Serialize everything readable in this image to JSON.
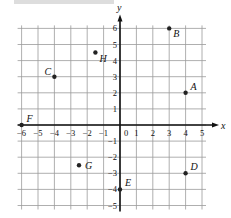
{
  "header": {
    "text": ""
  },
  "chart_data": {
    "type": "scatter",
    "title": "",
    "xlabel": "x",
    "ylabel": "y",
    "xlim": [
      -6,
      5
    ],
    "ylim": [
      -5,
      6
    ],
    "grid": true,
    "x_ticks": [
      "-6",
      "-5",
      "-4",
      "-3",
      "-2",
      "-1",
      "0",
      "1",
      "2",
      "3",
      "4",
      "5"
    ],
    "y_ticks": [
      "-5",
      "-4",
      "-3",
      "-2",
      "-1",
      "1",
      "2",
      "3",
      "4",
      "5",
      "6"
    ],
    "points": [
      {
        "label": "A",
        "x": 4,
        "y": 2,
        "label_pos": "above-right"
      },
      {
        "label": "B",
        "x": 3,
        "y": 6,
        "label_pos": "below-right"
      },
      {
        "label": "C",
        "x": -4,
        "y": 3,
        "label_pos": "above-left"
      },
      {
        "label": "D",
        "x": 4,
        "y": -3,
        "label_pos": "above-right"
      },
      {
        "label": "E",
        "x": 0,
        "y": -4,
        "label_pos": "above-right"
      },
      {
        "label": "F",
        "x": -6,
        "y": 0,
        "label_pos": "above-right"
      },
      {
        "label": "G",
        "x": -2.5,
        "y": -2.5,
        "label_pos": "right"
      },
      {
        "label": "H",
        "x": -1.5,
        "y": 4.5,
        "label_pos": "below-right"
      }
    ]
  },
  "colors": {
    "axis": "#111111",
    "grid": "#9a9a9a",
    "point": "#222222",
    "text": "#111111"
  }
}
